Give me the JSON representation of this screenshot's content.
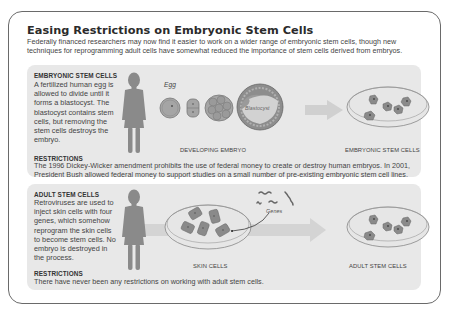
{
  "title": "Easing Restrictions on Embryonic Stem Cells",
  "subtitle": "Federally financed researchers may now find it easier to work on a wider range of embryonic stem cells, though new techniques for reprogramming adult cells have somewhat reduced the importance of stem cells derived from embryos.",
  "panels": [
    {
      "heading": "EMBRYONIC STEM CELLS",
      "description": "A fertilized human egg is allowed to divide until it forms a blastocyst. The blastocyst contains stem cells, but removing the stem cells destroys the embryo.",
      "restrictions_heading": "RESTRICTIONS",
      "restrictions_text": "The 1996 Dickey-Wicker amendment prohibits the use of federal money to create or destroy human embryos. In 2001, President Bush allowed federal money to support studies on a small number of pre-existing embryonic stem cell lines.",
      "labels": {
        "egg": "Egg",
        "blastocyst": "Blastocyst",
        "developing": "DEVELOPING EMBRYO",
        "result": "EMBRYONIC STEM CELLS"
      }
    },
    {
      "heading": "ADULT STEM CELLS",
      "description": "Retroviruses are used to inject skin cells with four genes, which somehow reprogram the skin cells to become stem cells. No embryo is destroyed in the process.",
      "restrictions_heading": "RESTRICTIONS",
      "restrictions_text": "There have never been any restrictions on working with adult stem cells.",
      "labels": {
        "genes": "Genes",
        "skin": "SKIN CELLS",
        "result": "ADULT STEM CELLS"
      }
    }
  ],
  "colors": {
    "panel_bg": "#e8e8e8",
    "figure": "#8a8a8a",
    "cell_fill": "#8f8f8f",
    "arrow": "#d0d0d0"
  }
}
